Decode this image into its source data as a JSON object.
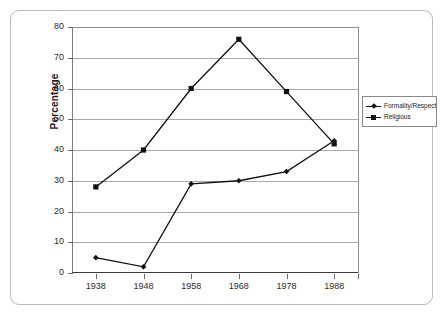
{
  "chart_data": {
    "type": "line",
    "title": "",
    "xlabel": "",
    "ylabel": "Percentage",
    "categories": [
      "1938",
      "1948",
      "1958",
      "1968",
      "1978",
      "1988"
    ],
    "x": [
      1938,
      1948,
      1958,
      1968,
      1978,
      1988
    ],
    "series": [
      {
        "name": "Formality/Respect",
        "marker": "diamond",
        "color": "#111111",
        "values": [
          5,
          2,
          29,
          30,
          33,
          43
        ]
      },
      {
        "name": "Religious",
        "marker": "square",
        "color": "#111111",
        "values": [
          28,
          40,
          60,
          76,
          59,
          42
        ]
      }
    ],
    "ylim": [
      0,
      80
    ],
    "ytick_values": [
      0,
      10,
      20,
      30,
      40,
      50,
      60,
      70,
      80
    ],
    "ytick_labels": [
      "0",
      "10",
      "20",
      "30",
      "40",
      "50",
      "60",
      "70",
      "80"
    ],
    "grid": true,
    "grid_axis": "y",
    "legend_position": "right",
    "colors": {
      "grid": "#a8a8a8",
      "axis": "#3a3a3a",
      "line": "#111111",
      "frame": "#b9b9b9",
      "background": "#ffffff",
      "text": "#2b2b2b"
    }
  },
  "legend": {
    "entries": [
      {
        "label": "Formality/Respect"
      },
      {
        "label": "Religious"
      }
    ]
  }
}
